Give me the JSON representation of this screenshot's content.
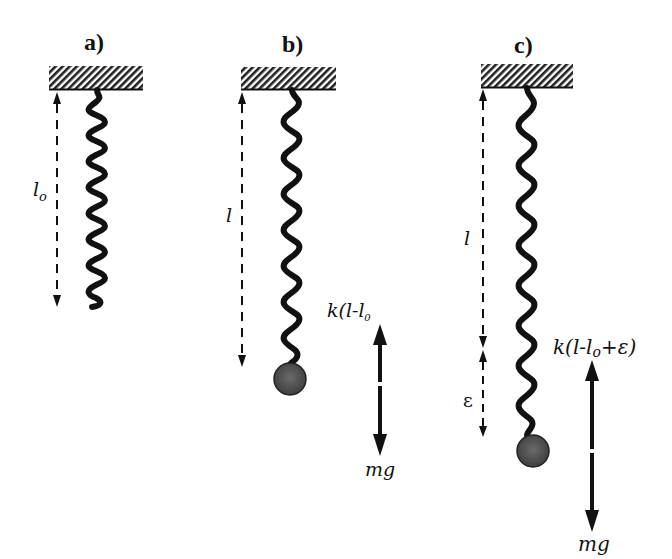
{
  "figure": {
    "colors": {
      "ink": "#111111",
      "ball_fill": "#555555",
      "background": "#ffffff"
    },
    "panels": [
      {
        "id": "a",
        "label": "a)",
        "length_label": "l",
        "length_subscript": "o",
        "has_mass": false
      },
      {
        "id": "b",
        "label": "b)",
        "length_label": "l",
        "has_mass": true,
        "force_up_label": "k(l-l₀)",
        "force_up_text": "k(l-l",
        "force_up_sub": "₀",
        "force_down_label": "mg"
      },
      {
        "id": "c",
        "label": "c)",
        "length_label": "l",
        "displacement_label": "ε",
        "has_mass": true,
        "force_up_label": "k(l-l₀+ε)",
        "force_up_text": "k(l-l",
        "force_up_sub": "o",
        "force_up_tail": "+ε)",
        "force_down_label": "mg"
      }
    ]
  }
}
